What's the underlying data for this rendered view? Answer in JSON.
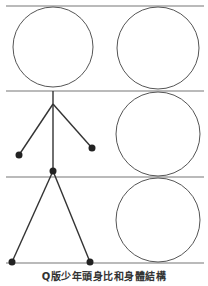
{
  "figure": {
    "caption": "Q版少年頭身比和身體結構",
    "stroke_color": "#555555",
    "joint_color": "#222222",
    "guide_lines_y": [
      6,
      91,
      177,
      263
    ],
    "head_units": 3,
    "left_figure": {
      "head": {
        "cx": 53,
        "cy": 47,
        "r": 40
      },
      "neck": {
        "x": 53,
        "y": 91
      },
      "shoulder": {
        "x": 53,
        "y": 104
      },
      "left_hand": {
        "x": 19,
        "y": 155
      },
      "right_hand": {
        "x": 92,
        "y": 148
      },
      "hip": {
        "x": 53,
        "y": 171
      },
      "left_foot": {
        "x": 12,
        "y": 262
      },
      "right_foot": {
        "x": 90,
        "y": 262
      }
    },
    "right_column_circles": [
      {
        "cx": 158,
        "cy": 48,
        "r": 42
      },
      {
        "cx": 158,
        "cy": 134,
        "r": 42
      },
      {
        "cx": 158,
        "cy": 220,
        "r": 42
      }
    ]
  }
}
